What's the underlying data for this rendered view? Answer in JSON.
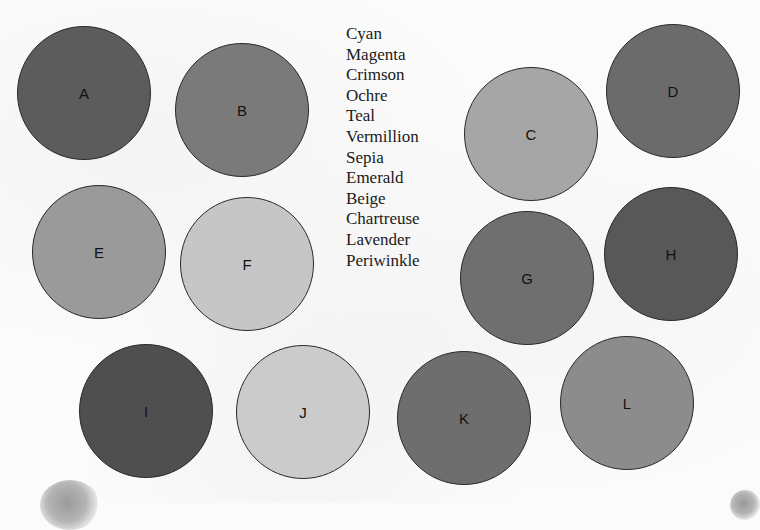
{
  "word_list": [
    "Cyan",
    "Magenta",
    "Crimson",
    "Ochre",
    "Teal",
    "Vermillion",
    "Sepia",
    "Emerald",
    "Beige",
    "Chartreuse",
    "Lavender",
    "Periwinkle"
  ],
  "circles": [
    {
      "label": "A",
      "cx": 84,
      "cy": 93,
      "color": "#5c5c5c"
    },
    {
      "label": "B",
      "cx": 242,
      "cy": 110,
      "color": "#7a7a7a"
    },
    {
      "label": "C",
      "cx": 531,
      "cy": 134,
      "color": "#a6a6a6"
    },
    {
      "label": "D",
      "cx": 673,
      "cy": 91,
      "color": "#6b6b6b"
    },
    {
      "label": "E",
      "cx": 99,
      "cy": 252,
      "color": "#9a9a9a"
    },
    {
      "label": "F",
      "cx": 247,
      "cy": 264,
      "color": "#c6c6c6"
    },
    {
      "label": "G",
      "cx": 527,
      "cy": 278,
      "color": "#6f6f6f"
    },
    {
      "label": "H",
      "cx": 671,
      "cy": 254,
      "color": "#585858"
    },
    {
      "label": "I",
      "cx": 146,
      "cy": 411,
      "color": "#4f4f4f"
    },
    {
      "label": "J",
      "cx": 303,
      "cy": 412,
      "color": "#cbcbcb"
    },
    {
      "label": "K",
      "cx": 464,
      "cy": 418,
      "color": "#6e6e6e"
    },
    {
      "label": "L",
      "cx": 627,
      "cy": 403,
      "color": "#8c8c8c"
    }
  ]
}
